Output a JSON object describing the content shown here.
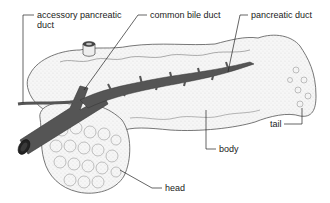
{
  "diagram": {
    "labels": {
      "accessory_duct_line1": "accessory pancreatic",
      "accessory_duct_line2": "duct",
      "common_bile_duct": "common bile duct",
      "pancreatic_duct": "pancreatic duct",
      "tail": "tail",
      "body": "body",
      "head": "head"
    },
    "colors": {
      "tissue_fill": "#f4f4f4",
      "tissue_outline": "#555555",
      "duct_fill": "#555555",
      "leader_line": "#222222",
      "text": "#1a1a1a"
    }
  }
}
